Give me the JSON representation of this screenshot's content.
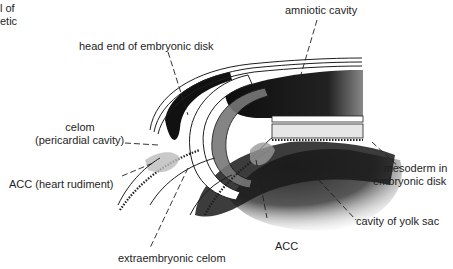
{
  "figure": {
    "type": "embryology cross-section illustration",
    "background": "#ffffff",
    "ink_color": "#1e1e1e"
  },
  "labels": {
    "cropped_top_left": [
      "l of",
      "etic"
    ],
    "amniotic_cavity": "amniotic cavity",
    "head_end": "head end of embryonic disk",
    "celom_line1": "celom",
    "celom_line2": "(pericardial cavity)",
    "acc_heart": "ACC (heart rudiment)",
    "mesoderm_line1": "mesoderm in",
    "mesoderm_line2": "embryonic disk",
    "yolk_sac": "cavity of yolk sac",
    "acc": "ACC",
    "extraembryonic_celom": "extraembryonic celom"
  }
}
